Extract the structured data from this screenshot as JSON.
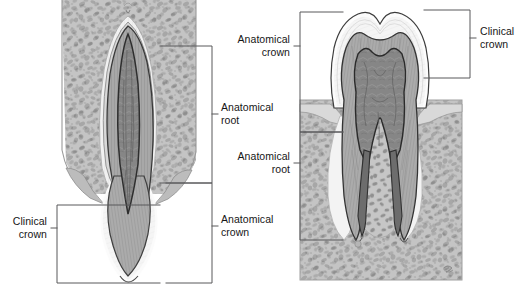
{
  "figure": {
    "background_color": "#ffffff",
    "line_color": "#58585a",
    "text_color": "#161616"
  },
  "panels": [
    {
      "id": "left-panel",
      "name": "single-rooted-tooth-panel",
      "description": "Longitudinal section of a single-rooted tooth (incisor) within alveolar bone",
      "tooth_type": "single-rooted incisor",
      "tissues": [
        {
          "name": "alveolar-bone",
          "color": "#b9b9b9"
        },
        {
          "name": "trabecular-marrow",
          "color": "#8c8c8c"
        },
        {
          "name": "periodontal-ligament",
          "color": "#efefef"
        },
        {
          "name": "cementum",
          "color": "#d6d6d6"
        },
        {
          "name": "dentin",
          "color": "#a3a3a3"
        },
        {
          "name": "pulp",
          "color": "#7c7c7c"
        },
        {
          "name": "enamel",
          "color": "#f2f2f2"
        }
      ],
      "brackets": [
        {
          "id": "left-anatomical-root",
          "label": "Anatomical\nroot",
          "side": "right",
          "align": "left"
        },
        {
          "id": "left-anatomical-crown",
          "label": "Anatomical\ncrown",
          "side": "right",
          "align": "left"
        },
        {
          "id": "left-clinical-crown",
          "label": "Clinical\ncrown",
          "side": "left",
          "align": "right"
        }
      ]
    },
    {
      "id": "right-panel",
      "name": "multi-rooted-tooth-panel",
      "description": "Longitudinal section of a two-rooted molar within alveolar bone",
      "tooth_type": "two-rooted molar",
      "tissues": [
        {
          "name": "alveolar-bone",
          "color": "#b9b9b9"
        },
        {
          "name": "trabecular-marrow",
          "color": "#8c8c8c"
        },
        {
          "name": "periodontal-ligament",
          "color": "#efefef"
        },
        {
          "name": "cementum",
          "color": "#d6d6d6"
        },
        {
          "name": "dentin",
          "color": "#a3a3a3"
        },
        {
          "name": "pulp",
          "color": "#7c7c7c"
        },
        {
          "name": "enamel",
          "color": "#f2f2f2"
        }
      ],
      "brackets": [
        {
          "id": "right-anatomical-crown",
          "label": "Anatomical\ncrown",
          "side": "left",
          "align": "right"
        },
        {
          "id": "right-anatomical-root",
          "label": "Anatomical\nroot",
          "side": "left",
          "align": "right"
        },
        {
          "id": "right-clinical-crown",
          "label": "Clinical\ncrown",
          "side": "right",
          "align": "left"
        }
      ]
    }
  ],
  "labels": {
    "left_anatomical_root": "Anatomical\nroot",
    "left_anatomical_crown": "Anatomical\ncrown",
    "left_clinical_crown": "Clinical\ncrown",
    "right_anatomical_crown": "Anatomical\ncrown",
    "right_anatomical_root": "Anatomical\nroot",
    "right_clinical_crown": "Clinical\ncrown"
  }
}
